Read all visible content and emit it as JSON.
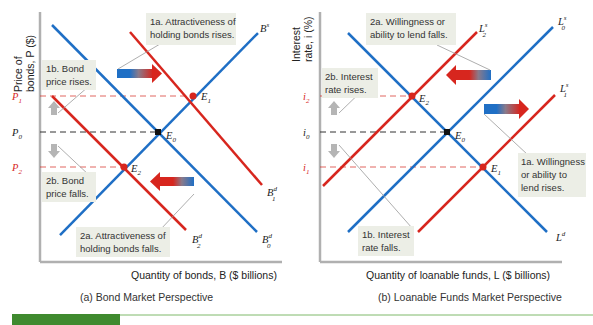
{
  "colors": {
    "blue": "#1f6fc5",
    "red": "#d7261e",
    "note_bg": "#eceee6",
    "axis": "#b0b0b0",
    "arrow_gray": "#b5b5b5",
    "green_bar": "#3f8a2f",
    "green_rule": "#7fb96a"
  },
  "panel_a": {
    "y_axis_label_line1": "Price of",
    "y_axis_label_line2": "bonds, P ($)",
    "x_axis_label": "Quantity of bonds, B ($ billions)",
    "caption": "(a) Bond Market Perspective",
    "price_labels": {
      "p1": "P",
      "p1_sub": "1",
      "p0": "P",
      "p0_sub": "0",
      "p2": "P",
      "p2_sub": "2"
    },
    "curves": {
      "supply": {
        "label": "B",
        "sup": "s"
      },
      "demand0": {
        "label": "B",
        "sup": "d",
        "sub": "0"
      },
      "demand1": {
        "label": "B",
        "sup": "d",
        "sub": "1"
      },
      "demand2": {
        "label": "B",
        "sup": "d",
        "sub": "2"
      }
    },
    "equilibria": {
      "e0": "E",
      "e0_sub": "0",
      "e1": "E",
      "e1_sub": "1",
      "e2": "E",
      "e2_sub": "2"
    },
    "notes": {
      "n1a_line1": "1a. Attractiveness of",
      "n1a_line2": "holding bonds rises.",
      "n1b_line1": "1b. Bond",
      "n1b_line2": "price rises.",
      "n2a_line1": "2a. Attractiveness of",
      "n2a_line2": "holding bonds falls.",
      "n2b_line1": "2b. Bond",
      "n2b_line2": "price falls."
    }
  },
  "panel_b": {
    "y_axis_label_line1": "Interest",
    "y_axis_label_line2": "rate, i (%)",
    "x_axis_label": "Quantity of loanable funds, L ($ billions)",
    "caption": "(b) Loanable Funds Market Perspective",
    "rate_labels": {
      "i2": "i",
      "i2_sub": "2",
      "i0": "i",
      "i0_sub": "0",
      "i1": "i",
      "i1_sub": "1"
    },
    "curves": {
      "demand": {
        "label": "L",
        "sup": "d"
      },
      "supply0": {
        "label": "L",
        "sup": "s",
        "sub": "0"
      },
      "supply1": {
        "label": "L",
        "sup": "s",
        "sub": "1"
      },
      "supply2": {
        "label": "L",
        "sup": "s",
        "sub": "2"
      }
    },
    "equilibria": {
      "e0": "E",
      "e0_sub": "0",
      "e1": "E",
      "e1_sub": "1",
      "e2": "E",
      "e2_sub": "2"
    },
    "notes": {
      "n1a_line1": "1a. Willingness",
      "n1a_line2": "or ability to",
      "n1a_line3": "lend rises.",
      "n1b_line1": "1b. Interest",
      "n1b_line2": "rate falls.",
      "n2a_line1": "2a. Willingness or",
      "n2a_line2": "ability to lend falls.",
      "n2b_line1": "2b. Interest",
      "n2b_line2": "rate rises."
    }
  }
}
